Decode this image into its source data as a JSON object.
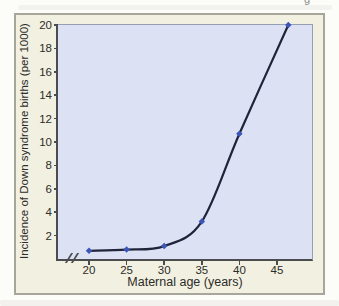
{
  "page": {
    "edge_glyph": "g"
  },
  "chart_data": {
    "type": "line",
    "title": "",
    "xlabel": "Maternal age (years)",
    "ylabel": "Incidence of Down syndrome births (per 1000)",
    "points": [
      {
        "x": 20,
        "y": 0.7
      },
      {
        "x": 25,
        "y": 0.8
      },
      {
        "x": 30,
        "y": 1.1
      },
      {
        "x": 35,
        "y": 3.2
      },
      {
        "x": 40,
        "y": 10.7
      },
      {
        "x": 46.5,
        "y": 20
      }
    ],
    "x_ticks": [
      20,
      25,
      30,
      35,
      40,
      45
    ],
    "y_ticks": [
      2,
      4,
      6,
      8,
      10,
      12,
      14,
      16,
      18,
      20
    ],
    "xlim": [
      16,
      50
    ],
    "ylim": [
      0,
      20
    ],
    "x_axis_break": true,
    "grid": false,
    "legend": "none",
    "colors": {
      "line": "#20243a",
      "marker": "#3b55b8",
      "plot_bg": "#dce2f4",
      "frame_bg": "#f2f0e1",
      "frame_border": "#a8a69b",
      "axis": "#4b4c4f",
      "plot_border": "#969eb3",
      "text": "#2c2c29"
    }
  }
}
